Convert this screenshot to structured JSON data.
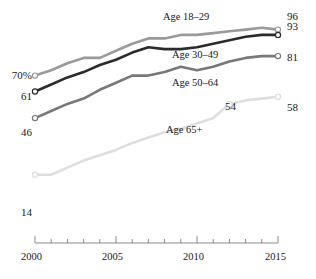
{
  "chart_data": {
    "type": "line",
    "title": "",
    "subtitle": "",
    "xlabel": "",
    "ylabel": "",
    "xlim": [
      2000,
      2015
    ],
    "ylim": [
      0,
      100
    ],
    "grid": false,
    "legend_position": "inline-labels",
    "x": [
      2000,
      2001,
      2002,
      2003,
      2004,
      2005,
      2006,
      2007,
      2008,
      2009,
      2010,
      2011,
      2012,
      2013,
      2014,
      2015
    ],
    "x_tick_labels": [
      "2000",
      "2005",
      "2010",
      "2015"
    ],
    "x_major_ticks": [
      2000,
      2005,
      2010,
      2015
    ],
    "x_minor_ticks": [
      2001,
      2002,
      2003,
      2004,
      2006,
      2007,
      2008,
      2009,
      2011,
      2012,
      2013,
      2014
    ],
    "series": [
      {
        "name": "Age 18–29",
        "color": "#9a9a9a",
        "start_label": "70%",
        "end_label": "96",
        "start_value": 70,
        "end_value": 96,
        "values": [
          70,
          73,
          77,
          80,
          80,
          84,
          88,
          91,
          91,
          93,
          93,
          94,
          95,
          96,
          97,
          96
        ]
      },
      {
        "name": "Age 30–49",
        "color": "#2b2b2b",
        "start_label": "61",
        "end_label": "93",
        "start_value": 61,
        "end_value": 93,
        "values": [
          61,
          65,
          69,
          72,
          76,
          79,
          83,
          86,
          85,
          85,
          86,
          88,
          90,
          92,
          93,
          93
        ]
      },
      {
        "name": "Age 50–64",
        "color": "#787878",
        "start_label": "46",
        "end_label": "81",
        "start_value": 46,
        "end_value": 81,
        "values": [
          46,
          50,
          54,
          57,
          62,
          66,
          70,
          70,
          72,
          75,
          73,
          75,
          78,
          80,
          81,
          81
        ]
      },
      {
        "name": "Age 65+",
        "color": "#dedede",
        "start_label": "14",
        "end_label": "58",
        "start_value": 14,
        "end_value": 58,
        "annotation_label": "54",
        "annotation_year": 2012,
        "annotation_value": 54,
        "values": [
          14,
          14,
          18,
          22,
          25,
          28,
          32,
          35,
          38,
          40,
          43,
          46,
          54,
          56,
          57,
          58
        ]
      }
    ]
  },
  "axis": {
    "tick_2000": "2000",
    "tick_2005": "2005",
    "tick_2010": "2010",
    "tick_2015": "2015"
  },
  "labels": {
    "start_70": "70%",
    "start_61": "61",
    "start_46": "46",
    "start_14": "14",
    "end_96": "96",
    "end_93": "93",
    "end_81": "81",
    "end_58": "58",
    "annot_54": "54",
    "series_18_29": "Age 18–29",
    "series_30_49": "Age 30–49",
    "series_50_64": "Age 50–64",
    "series_65plus": "Age 65+"
  },
  "colors": {
    "axis": "#8a8a8a",
    "text": "#1a1a1a",
    "s1": "#9a9a9a",
    "s2": "#2b2b2b",
    "s3": "#787878",
    "s4": "#dedede"
  }
}
